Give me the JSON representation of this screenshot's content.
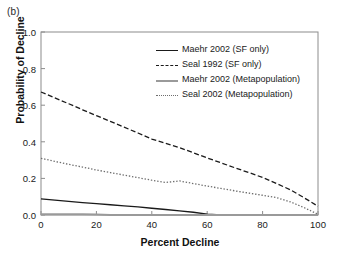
{
  "panel": {
    "label": "(b)"
  },
  "chart_data": {
    "type": "line",
    "title": "",
    "panel_label": "(b)",
    "xlabel": "Percent Decline",
    "ylabel": "Probability of Decline",
    "xlim": [
      0,
      100
    ],
    "ylim": [
      0,
      1.0
    ],
    "xticks": [
      0,
      20,
      40,
      60,
      80,
      100
    ],
    "yticks": [
      0.0,
      0.2,
      0.4,
      0.6,
      0.8,
      1.0
    ],
    "xtick_labels": [
      "0",
      "20",
      "40",
      "60",
      "80",
      "100"
    ],
    "ytick_labels": [
      "0.0",
      "0.2",
      "0.4",
      "0.6",
      "0.8",
      "1.0"
    ],
    "grid": false,
    "legend_position": "upper right",
    "x": [
      0,
      5,
      10,
      15,
      20,
      25,
      30,
      35,
      40,
      45,
      50,
      55,
      60,
      65,
      70,
      75,
      80,
      85,
      90,
      95,
      100
    ],
    "series": [
      {
        "name": "Maehr 2002 (SF only)",
        "style": "solid",
        "color": "#1a1a1a",
        "values": [
          0.088,
          0.081,
          0.074,
          0.068,
          0.062,
          0.056,
          0.05,
          0.044,
          0.037,
          0.03,
          0.023,
          0.015,
          0.005,
          0.0,
          0.0,
          0.0,
          0.0,
          0.0,
          0.0,
          0.0,
          0.0
        ]
      },
      {
        "name": "Seal 1992 (SF only)",
        "style": "dashed",
        "color": "#1a1a1a",
        "values": [
          0.672,
          0.64,
          0.608,
          0.575,
          0.543,
          0.512,
          0.48,
          0.448,
          0.415,
          0.392,
          0.368,
          0.34,
          0.312,
          0.285,
          0.258,
          0.232,
          0.205,
          0.172,
          0.138,
          0.094,
          0.048
        ]
      },
      {
        "name": "Maehr 2002 (Metapopulation)",
        "style": "solid",
        "color": "#9a9a9a",
        "values": [
          0.004,
          0.004,
          0.004,
          0.004,
          0.003,
          0.0,
          0.0,
          0.0,
          0.0,
          0.0,
          0.0,
          0.0,
          0.0,
          0.0,
          0.0,
          0.0,
          0.0,
          0.0,
          0.0,
          0.0,
          0.0
        ]
      },
      {
        "name": "Seal 2002 (Metapopulation)",
        "style": "dotted",
        "color": "#6e6e6e",
        "values": [
          0.31,
          0.293,
          0.277,
          0.262,
          0.246,
          0.232,
          0.218,
          0.204,
          0.19,
          0.178,
          0.186,
          0.172,
          0.158,
          0.145,
          0.132,
          0.12,
          0.108,
          0.095,
          0.072,
          0.04,
          0.004
        ]
      }
    ]
  },
  "legend": {
    "items": [
      {
        "label": "Maehr 2002 (SF only)",
        "style": "solid",
        "color": "#1a1a1a"
      },
      {
        "label": "Seal 1992 (SF only)",
        "style": "dashed",
        "color": "#1a1a1a"
      },
      {
        "label": "Maehr 2002 (Metapopulation)",
        "style": "solid",
        "color": "#9a9a9a"
      },
      {
        "label": "Seal 2002 (Metapopulation)",
        "style": "dotted",
        "color": "#6e6e6e"
      }
    ]
  },
  "axes": {
    "frame_color": "#8c8c8c",
    "x_title": "Percent Decline",
    "y_title": "Probability of Decline"
  }
}
